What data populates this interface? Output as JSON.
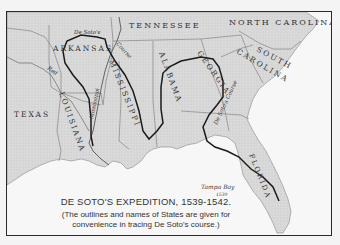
{
  "map": {
    "title": "DE SOTO'S EXPEDITION, 1539-1542.",
    "note_line1": "(The outlines and names of States are given for",
    "note_line2": "convenience in tracing De Soto's course.)",
    "states": {
      "tennessee": "TENNESSEE",
      "north_carolina": "NORTH CAROLINA",
      "south": "SOUTH",
      "carolina": "CAROLINA",
      "arkansas": "ARKANSAS",
      "mississippi": "MISSISSIPPI",
      "alabama": "ALABAMA",
      "georgia": "GEORGIA",
      "louisiana": "LOUISIANA",
      "texas": "TEXAS",
      "florida": "FLORIDA"
    },
    "rivers": {
      "mississippi": "Mississippi",
      "red": "Red"
    },
    "route_labels": {
      "de_sotos": "De Soto's",
      "course": "Course",
      "de_sotos_course": "De Soto's Course"
    },
    "places": {
      "tampa_bay": "Tampa Bay",
      "tampa_year": "1539"
    },
    "colors": {
      "land": "#d9d9d9",
      "water": "#f7f7f7",
      "border": "#2a2a2a",
      "route": "#1a1a1a",
      "state_line": "#777777"
    }
  }
}
